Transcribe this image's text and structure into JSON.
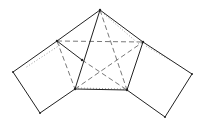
{
  "diagram": {
    "type": "geometric-net",
    "stroke_color": "#222222",
    "background": "#ffffff",
    "vertices": {
      "apex": [
        100,
        10
      ],
      "upper_left": [
        57,
        41
      ],
      "upper_right": [
        143,
        42
      ],
      "inner_left": [
        82,
        60
      ],
      "pent_bottom_left": [
        75,
        89
      ],
      "pent_bottom_right": [
        127,
        90
      ],
      "far_left": [
        13,
        72
      ],
      "sq_left_bottom": [
        40,
        113
      ],
      "far_right": [
        192,
        74
      ],
      "sq_right_bottom": [
        165,
        117
      ]
    },
    "solid_edges": [
      [
        "apex",
        "upper_left"
      ],
      [
        "apex",
        "upper_right"
      ],
      [
        "upper_left",
        "far_left"
      ],
      [
        "far_left",
        "sq_left_bottom"
      ],
      [
        "sq_left_bottom",
        "pent_bottom_left"
      ],
      [
        "upper_left",
        "inner_left"
      ],
      [
        "apex",
        "inner_left"
      ],
      [
        "inner_left",
        "pent_bottom_left"
      ],
      [
        "pent_bottom_left",
        "pent_bottom_right"
      ],
      [
        "pent_bottom_right",
        "upper_right"
      ],
      [
        "upper_right",
        "far_right"
      ],
      [
        "far_right",
        "sq_right_bottom"
      ],
      [
        "sq_right_bottom",
        "pent_bottom_right"
      ]
    ],
    "dashed_edges": [
      [
        "upper_left",
        "upper_right"
      ],
      [
        "upper_left",
        "pent_bottom_left"
      ],
      [
        "apex",
        "pent_bottom_right"
      ],
      [
        "inner_left",
        "pent_bottom_right"
      ],
      [
        "pent_bottom_left",
        "upper_right"
      ]
    ]
  }
}
